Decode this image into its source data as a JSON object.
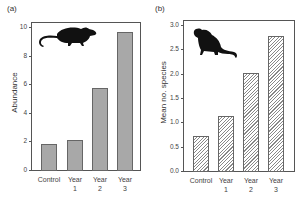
{
  "chart_data": [
    {
      "type": "bar",
      "panel": "(a)",
      "title": "",
      "xlabel": "",
      "ylabel": "Abundance",
      "categories": [
        "Control",
        "Year 1",
        "Year 2",
        "Year 3"
      ],
      "category_lines": [
        [
          "Control",
          ""
        ],
        [
          "Year",
          "1"
        ],
        [
          "Year",
          "2"
        ],
        [
          "Year",
          "3"
        ]
      ],
      "values": [
        1.85,
        2.1,
        5.75,
        9.65
      ],
      "ylim": [
        0,
        10
      ],
      "yticks": [
        "0",
        "2",
        "4",
        "6",
        "8",
        "10"
      ],
      "fill": "solid gray",
      "grid": false,
      "annotation": "rat silhouette"
    },
    {
      "type": "bar",
      "panel": "(b)",
      "title": "",
      "xlabel": "",
      "ylabel": "Mean no. species",
      "categories": [
        "Control",
        "Year 1",
        "Year 2",
        "Year 3"
      ],
      "category_lines": [
        [
          "Control",
          ""
        ],
        [
          "Year",
          "1"
        ],
        [
          "Year",
          "2"
        ],
        [
          "Year",
          "3"
        ]
      ],
      "values": [
        0.72,
        1.12,
        2.02,
        2.77
      ],
      "ylim": [
        0,
        3.0
      ],
      "yticks": [
        "0.0",
        "0.5",
        "1.0",
        "1.5",
        "2.0",
        "2.5",
        "3.0"
      ],
      "fill": "hatched",
      "grid": false,
      "annotation": "rat silhouette"
    }
  ],
  "panels": {
    "a": {
      "label": "(a)",
      "ylabel": "Abundance"
    },
    "b": {
      "label": "(b)",
      "ylabel": "Mean no. species"
    }
  }
}
